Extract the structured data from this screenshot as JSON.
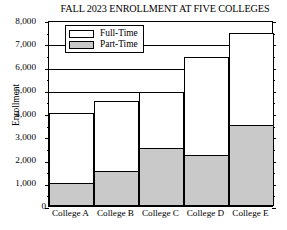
{
  "chart_data": {
    "type": "bar",
    "subtype": "stacked-vertical",
    "title": "FALL 2023 ENROLLMENT AT FIVE COLLEGES",
    "xlabel": "",
    "ylabel": "Enrollment",
    "categories": [
      "College A",
      "College B",
      "College C",
      "College D",
      "College E"
    ],
    "series": [
      {
        "name": "Part-Time",
        "color": "#c9c9c9",
        "values": [
          1000,
          1500,
          2500,
          2200,
          3500
        ]
      },
      {
        "name": "Full-Time",
        "color": "#ffffff",
        "values": [
          3000,
          3000,
          2400,
          4200,
          3950
        ]
      }
    ],
    "totals": [
      4000,
      4500,
      4900,
      6400,
      7450
    ],
    "ylim": [
      0,
      8000
    ],
    "y_major_step": 1000,
    "y_minor_step": 500,
    "y_tick_labels": [
      "8,000",
      "7,000",
      "6,000",
      "5,000",
      "4,000",
      "3,000",
      "2,000",
      "1,000",
      "0"
    ],
    "y_tick_values": [
      8000,
      7000,
      6000,
      5000,
      4000,
      3000,
      2000,
      1000,
      0
    ],
    "grid": true,
    "grid_axis": "y",
    "legend": {
      "position": "top-left-inside",
      "bordered": true,
      "entries": [
        {
          "label": "Full-Time",
          "color": "#ffffff"
        },
        {
          "label": "Part-Time",
          "color": "#c9c9c9"
        }
      ]
    },
    "bar_gap": 0,
    "axis_color": "#000000",
    "background": "#ffffff"
  }
}
